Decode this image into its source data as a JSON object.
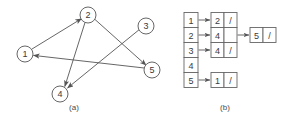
{
  "figure": {
    "caption_a": "(a)",
    "caption_b": "(b)",
    "stroke_color": "#555555",
    "text_color": "#3a3a3a",
    "box_fill": "#ffffff",
    "box_stroke": "#666666"
  },
  "graph": {
    "name": "directed-graph",
    "nodes": [
      {
        "id": "1",
        "label": "1",
        "cx": 25,
        "cy": 54,
        "r": 8
      },
      {
        "id": "2",
        "label": "2",
        "cx": 88,
        "cy": 15,
        "r": 8
      },
      {
        "id": "3",
        "label": "3",
        "cx": 146,
        "cy": 26,
        "r": 8
      },
      {
        "id": "4",
        "label": "4",
        "cx": 60,
        "cy": 94,
        "r": 8
      },
      {
        "id": "5",
        "label": "5",
        "cx": 152,
        "cy": 70,
        "r": 8
      }
    ],
    "edges": [
      {
        "from": "1",
        "to": "2"
      },
      {
        "from": "2",
        "to": "4"
      },
      {
        "from": "2",
        "to": "5"
      },
      {
        "from": "3",
        "to": "4"
      },
      {
        "from": "5",
        "to": "1"
      }
    ]
  },
  "adjacency_list": {
    "name": "adjacency-list",
    "index_labels": [
      "1",
      "2",
      "3",
      "4",
      "5"
    ],
    "rows": [
      {
        "index": "1",
        "nodes": [
          {
            "value": "2",
            "next": "null"
          }
        ]
      },
      {
        "index": "2",
        "nodes": [
          {
            "value": "4",
            "next": "pointer"
          },
          {
            "value": "5",
            "next": "null"
          }
        ]
      },
      {
        "index": "3",
        "nodes": [
          {
            "value": "4",
            "next": "null"
          }
        ]
      },
      {
        "index": "4",
        "nodes": []
      },
      {
        "index": "5",
        "nodes": [
          {
            "value": "1",
            "next": "null"
          }
        ]
      }
    ],
    "null_glyph": "/"
  }
}
